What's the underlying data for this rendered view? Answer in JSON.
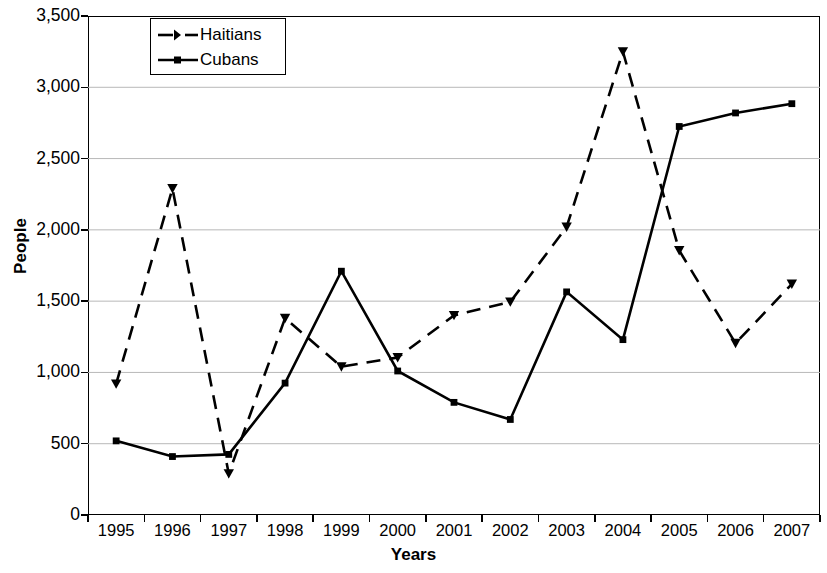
{
  "chart_data": {
    "type": "line",
    "title": "",
    "subtitle": "",
    "xlabel": "Years",
    "ylabel": "People",
    "categories": [
      "1995",
      "1996",
      "1997",
      "1998",
      "1999",
      "2000",
      "2001",
      "2002",
      "2003",
      "2004",
      "2005",
      "2006",
      "2007"
    ],
    "x": [
      1995,
      1996,
      1997,
      1998,
      1999,
      2000,
      2001,
      2002,
      2003,
      2004,
      2005,
      2006,
      2007
    ],
    "series": [
      {
        "name": "Haitians",
        "style": "dashed",
        "marker": "triangle",
        "color": "#000000",
        "values": [
          920,
          2290,
          290,
          1380,
          1040,
          1105,
          1400,
          1495,
          2020,
          3250,
          1855,
          1205,
          1620
        ]
      },
      {
        "name": "Cubans",
        "style": "solid",
        "marker": "square",
        "color": "#000000",
        "values": [
          520,
          410,
          425,
          925,
          1710,
          1010,
          790,
          670,
          1565,
          1230,
          2725,
          2820,
          2885
        ]
      }
    ],
    "ylim": [
      0,
      3500
    ],
    "ytick_step": 500,
    "yticks": [
      0,
      500,
      1000,
      1500,
      2000,
      2500,
      3000,
      3500
    ],
    "ytick_labels": [
      "0",
      "500",
      "1,000",
      "1,500",
      "2,000",
      "2,500",
      "3,000",
      "3,500"
    ],
    "xtick_labels": [
      "1995",
      "1996",
      "1997",
      "1998",
      "1999",
      "2000",
      "2001",
      "2002",
      "2003",
      "2004",
      "2005",
      "2006",
      "2007"
    ],
    "grid": {
      "horizontal": true,
      "vertical": false,
      "color": "#b8b8b8"
    },
    "legend": {
      "position": "top-left-inside",
      "entries": [
        "Haitians",
        "Cubans"
      ]
    },
    "frame_color": "#000000",
    "background": "#ffffff"
  },
  "legend": {
    "entries": [
      {
        "label": "Haitians",
        "icon": "dashed-line-triangle-marker-icon"
      },
      {
        "label": "Cubans",
        "icon": "solid-line-square-marker-icon"
      }
    ]
  },
  "axes": {
    "y_title": "People",
    "x_title": "Years"
  }
}
